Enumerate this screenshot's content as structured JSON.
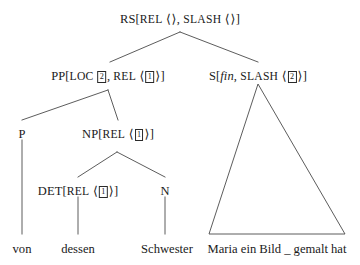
{
  "figure": {
    "type": "syntax-tree",
    "formalism": "HPSG",
    "language": "German",
    "background_color": "#ffffff",
    "line_color": "#4a4a4a",
    "text_color": "#1a1a1a"
  },
  "nodes": {
    "root": {
      "id": "RS",
      "category": "RS",
      "bracket_open": "[",
      "bracket_close": "]",
      "features": [
        {
          "name": "REL",
          "angle_open": "⟨",
          "tag": "",
          "angle_close": "⟩",
          "sep": ", "
        },
        {
          "name": "SLASH",
          "angle_open": "⟨",
          "tag": "",
          "angle_close": "⟩",
          "sep": ""
        }
      ],
      "x": 180,
      "y": 13
    },
    "pp": {
      "id": "PP",
      "category": "PP",
      "bracket_open": "[",
      "bracket_close": "]",
      "loc_label": "LOC",
      "loc_tag": "2",
      "features": [
        {
          "name": "REL",
          "angle_open": "⟨",
          "tag": "1",
          "angle_close": "⟩",
          "sep": ""
        }
      ],
      "x": 108,
      "y": 70
    },
    "s": {
      "id": "S",
      "category": "S",
      "bracket_open": "[",
      "bracket_close": "]",
      "italic_feature": "fin",
      "features": [
        {
          "name": "SLASH",
          "angle_open": "⟨",
          "tag": "2",
          "angle_close": "⟩",
          "sep": ""
        }
      ],
      "x": 258,
      "y": 70
    },
    "p": {
      "id": "P",
      "category": "P",
      "x": 22,
      "y": 128
    },
    "np": {
      "id": "NP",
      "category": "NP",
      "bracket_open": "[",
      "bracket_close": "]",
      "features": [
        {
          "name": "REL",
          "angle_open": "⟨",
          "tag": "1",
          "angle_close": "⟩",
          "sep": ""
        }
      ],
      "x": 118,
      "y": 128
    },
    "det": {
      "id": "DET",
      "category": "DET",
      "bracket_open": "[",
      "bracket_close": "]",
      "features": [
        {
          "name": "REL",
          "angle_open": "⟨",
          "tag": "1",
          "angle_close": "⟩",
          "sep": ""
        }
      ],
      "x": 78,
      "y": 185
    },
    "n": {
      "id": "N",
      "category": "N",
      "x": 165,
      "y": 185
    }
  },
  "words": {
    "von": {
      "text": "von",
      "x": 22,
      "y": 243
    },
    "dessen": {
      "text": "dessen",
      "x": 78,
      "y": 243
    },
    "schwester": {
      "text": "Schwester",
      "x": 167,
      "y": 243
    },
    "clause": {
      "text": "Maria ein Bild _ gemalt hat",
      "x": 277,
      "y": 243
    }
  },
  "triangle": {
    "apex_x": 258,
    "apex_y": 84,
    "left_x": 209,
    "right_x": 345,
    "base_y": 234
  },
  "edges": [
    {
      "from": "root",
      "to": "pp",
      "x1": 180,
      "y1": 32,
      "x2": 110,
      "y2": 62
    },
    {
      "from": "root",
      "to": "s",
      "x1": 180,
      "y1": 32,
      "x2": 258,
      "y2": 62
    },
    {
      "from": "pp",
      "to": "p",
      "x1": 108,
      "y1": 90,
      "x2": 22,
      "y2": 120
    },
    {
      "from": "pp",
      "to": "np",
      "x1": 108,
      "y1": 90,
      "x2": 118,
      "y2": 120
    },
    {
      "from": "np",
      "to": "det",
      "x1": 117,
      "y1": 152,
      "x2": 78,
      "y2": 177
    },
    {
      "from": "np",
      "to": "n",
      "x1": 117,
      "y1": 152,
      "x2": 165,
      "y2": 177
    },
    {
      "from": "p",
      "to": "von",
      "x1": 22,
      "y1": 140,
      "x2": 22,
      "y2": 234
    },
    {
      "from": "det",
      "to": "dessen",
      "x1": 78,
      "y1": 197,
      "x2": 78,
      "y2": 234
    },
    {
      "from": "n",
      "to": "schwester",
      "x1": 165,
      "y1": 197,
      "x2": 165,
      "y2": 234
    }
  ]
}
